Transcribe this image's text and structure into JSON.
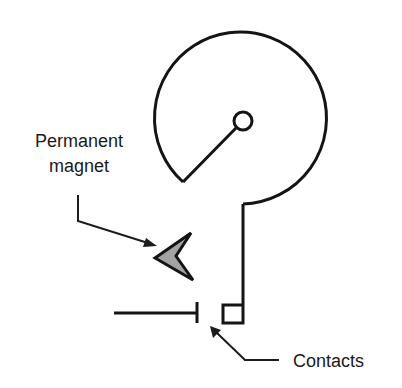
{
  "diagram": {
    "type": "reed-switch / magnetic contact schematic",
    "labels": {
      "magnet_line1": "Permanent",
      "magnet_line2": "magnet",
      "contacts": "Contacts"
    },
    "colors": {
      "stroke": "#141414",
      "magnet_fill": "#a3a3a3",
      "background": "#ffffff"
    },
    "components": [
      {
        "id": "rotor",
        "shape": "circular sector with pivot",
        "description": "Large circular arm with pivot circle at center"
      },
      {
        "id": "pivot",
        "shape": "small circle"
      },
      {
        "id": "permanent-magnet",
        "shape": "grey arrowhead (chevron)"
      },
      {
        "id": "fixed-contact",
        "shape": "horizontal line with vertical bar end"
      },
      {
        "id": "moving-contact",
        "shape": "small square at end of stem"
      }
    ]
  }
}
